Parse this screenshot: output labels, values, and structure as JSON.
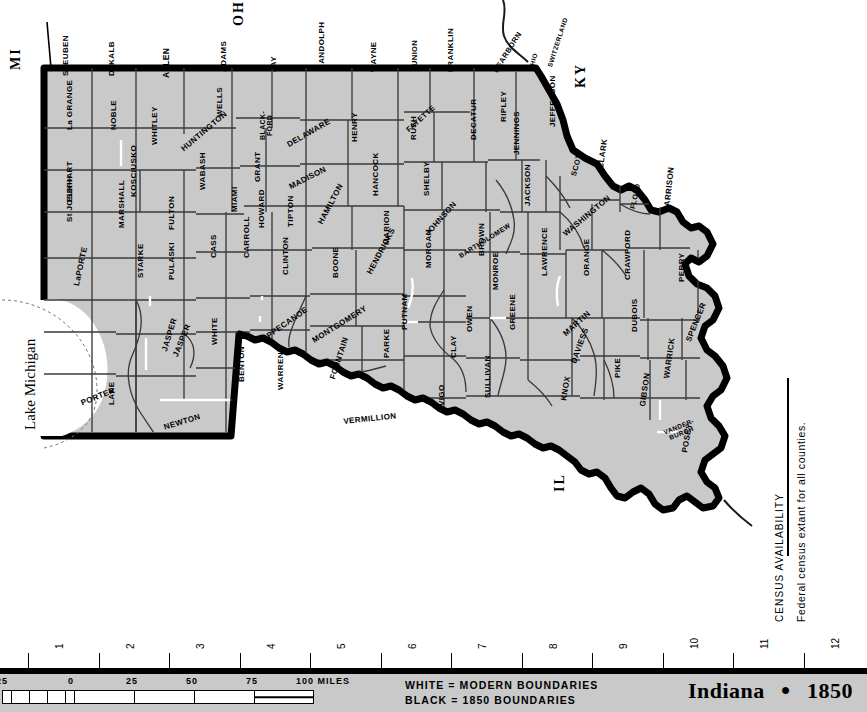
{
  "header": {
    "state_abbr": "IN",
    "year": "1850",
    "separator": "●",
    "page_number": "111"
  },
  "map": {
    "title_state": "Indiana",
    "title_year": "1850",
    "title_separator": "●",
    "neighbors": [
      {
        "id": "mi",
        "label": "MI"
      },
      {
        "id": "oh",
        "label": "OH"
      },
      {
        "id": "ky",
        "label": "KY"
      },
      {
        "id": "il",
        "label": "IL"
      }
    ],
    "water": {
      "lake_label": "Lake Michigan"
    },
    "counties": [
      {
        "name": "STEUBEN",
        "x": 62,
        "y": 76,
        "rot": -90,
        "size": 8
      },
      {
        "name": "DeKALB",
        "x": 108,
        "y": 76,
        "rot": -90,
        "size": 8
      },
      {
        "name": "ALLEN",
        "x": 162,
        "y": 78,
        "rot": -90,
        "size": 8.5
      },
      {
        "name": "ADAMS",
        "x": 220,
        "y": 72,
        "rot": -90,
        "size": 8
      },
      {
        "name": "WELLS",
        "x": 216,
        "y": 117,
        "rot": -90,
        "size": 8
      },
      {
        "name": "JAY",
        "x": 270,
        "y": 72,
        "rot": -90,
        "size": 8
      },
      {
        "name": "RANDOLPH",
        "x": 318,
        "y": 70,
        "rot": -90,
        "size": 8
      },
      {
        "name": "WAYNE",
        "x": 370,
        "y": 72,
        "rot": -90,
        "size": 8
      },
      {
        "name": "UNION",
        "x": 411,
        "y": 66,
        "rot": -90,
        "size": 7.5
      },
      {
        "name": "FAYETTE",
        "x": 405,
        "y": 128,
        "rot": -42,
        "size": 7.5
      },
      {
        "name": "FRANKLIN",
        "x": 447,
        "y": 72,
        "rot": -90,
        "size": 8
      },
      {
        "name": "DEARBORN",
        "x": 492,
        "y": 70,
        "rot": -58,
        "size": 7.5
      },
      {
        "name": "OHIO",
        "x": 528,
        "y": 70,
        "rot": -75,
        "size": 6.5
      },
      {
        "name": "SWITZERLAND",
        "x": 547,
        "y": 66,
        "rot": -72,
        "size": 6.5
      },
      {
        "name": "La GRANGE",
        "x": 66,
        "y": 130,
        "rot": -90,
        "size": 8
      },
      {
        "name": "NOBLE",
        "x": 110,
        "y": 130,
        "rot": -90,
        "size": 8
      },
      {
        "name": "WHITLEY",
        "x": 151,
        "y": 145,
        "rot": -90,
        "size": 8
      },
      {
        "name": "HUNTINGTON",
        "x": 180,
        "y": 147,
        "rot": -40,
        "size": 8
      },
      {
        "name": "BLACK-\nFORD",
        "x": 259,
        "y": 140,
        "rot": -90,
        "size": 7
      },
      {
        "name": "DELAWARE",
        "x": 286,
        "y": 142,
        "rot": -30,
        "size": 8
      },
      {
        "name": "HENRY",
        "x": 351,
        "y": 142,
        "rot": -90,
        "size": 8
      },
      {
        "name": "RUSH",
        "x": 410,
        "y": 140,
        "rot": -90,
        "size": 8
      },
      {
        "name": "DECATUR",
        "x": 470,
        "y": 140,
        "rot": -90,
        "size": 8
      },
      {
        "name": "RIPLEY",
        "x": 500,
        "y": 122,
        "rot": -90,
        "size": 8
      },
      {
        "name": "JENNINGS",
        "x": 513,
        "y": 155,
        "rot": -90,
        "size": 8
      },
      {
        "name": "JEFFERSON",
        "x": 549,
        "y": 127,
        "rot": -90,
        "size": 8
      },
      {
        "name": "SCOTT",
        "x": 570,
        "y": 175,
        "rot": -75,
        "size": 7.5
      },
      {
        "name": "CLARK",
        "x": 597,
        "y": 168,
        "rot": -82,
        "size": 8
      },
      {
        "name": "ELKHART",
        "x": 66,
        "y": 202,
        "rot": -90,
        "size": 8
      },
      {
        "name": "KOSCIUSKO",
        "x": 130,
        "y": 197,
        "rot": -90,
        "size": 8
      },
      {
        "name": "WABASH",
        "x": 199,
        "y": 190,
        "rot": -90,
        "size": 8
      },
      {
        "name": "MIAMI",
        "x": 231,
        "y": 212,
        "rot": -90,
        "size": 8
      },
      {
        "name": "GRANT",
        "x": 254,
        "y": 182,
        "rot": -90,
        "size": 8
      },
      {
        "name": "MADISON",
        "x": 288,
        "y": 184,
        "rot": -27,
        "size": 8
      },
      {
        "name": "HANCOCK",
        "x": 372,
        "y": 196,
        "rot": -90,
        "size": 8
      },
      {
        "name": "SHELBY",
        "x": 423,
        "y": 196,
        "rot": -90,
        "size": 8
      },
      {
        "name": "BARTHOLOMEW",
        "x": 458,
        "y": 254,
        "rot": -32,
        "size": 6.8
      },
      {
        "name": "JACKSON",
        "x": 524,
        "y": 206,
        "rot": -90,
        "size": 8
      },
      {
        "name": "WASHINGTON",
        "x": 562,
        "y": 232,
        "rot": -40,
        "size": 8
      },
      {
        "name": "FLOYD",
        "x": 629,
        "y": 208,
        "rot": -78,
        "size": 7
      },
      {
        "name": "HARRISON",
        "x": 663,
        "y": 212,
        "rot": -84,
        "size": 8
      },
      {
        "name": "St JOSEPH",
        "x": 66,
        "y": 222,
        "rot": -90,
        "size": 8
      },
      {
        "name": "MARSHALL",
        "x": 118,
        "y": 228,
        "rot": -90,
        "size": 8
      },
      {
        "name": "FULTON",
        "x": 168,
        "y": 230,
        "rot": -90,
        "size": 8
      },
      {
        "name": "HOWARD",
        "x": 258,
        "y": 228,
        "rot": -90,
        "size": 8
      },
      {
        "name": "TIPTON",
        "x": 287,
        "y": 227,
        "rot": -90,
        "size": 8
      },
      {
        "name": "HAMILTON",
        "x": 317,
        "y": 222,
        "rot": -62,
        "size": 8
      },
      {
        "name": "MARION",
        "x": 383,
        "y": 245,
        "rot": -90,
        "size": 8
      },
      {
        "name": "JOHNSON",
        "x": 424,
        "y": 232,
        "rot": -48,
        "size": 8
      },
      {
        "name": "CASS",
        "x": 210,
        "y": 258,
        "rot": -90,
        "size": 8
      },
      {
        "name": "CARROLL",
        "x": 243,
        "y": 258,
        "rot": -90,
        "size": 8
      },
      {
        "name": "LaPORTE",
        "x": 73,
        "y": 285,
        "rot": -78,
        "size": 8
      },
      {
        "name": "STARKE",
        "x": 137,
        "y": 278,
        "rot": -90,
        "size": 8
      },
      {
        "name": "PULASKI",
        "x": 168,
        "y": 280,
        "rot": -90,
        "size": 8
      },
      {
        "name": "WHITE",
        "x": 211,
        "y": 345,
        "rot": -90,
        "size": 8
      },
      {
        "name": "CLINTON",
        "x": 282,
        "y": 275,
        "rot": -90,
        "size": 8
      },
      {
        "name": "BOONE",
        "x": 332,
        "y": 278,
        "rot": -90,
        "size": 8
      },
      {
        "name": "HENDRICKS",
        "x": 366,
        "y": 272,
        "rot": -62,
        "size": 8
      },
      {
        "name": "MORGAN",
        "x": 425,
        "y": 268,
        "rot": -90,
        "size": 8
      },
      {
        "name": "BROWN",
        "x": 478,
        "y": 256,
        "rot": -90,
        "size": 8
      },
      {
        "name": "MONROE",
        "x": 492,
        "y": 290,
        "rot": -90,
        "size": 8
      },
      {
        "name": "LAWRENCE",
        "x": 541,
        "y": 276,
        "rot": -90,
        "size": 8
      },
      {
        "name": "ORANGE",
        "x": 583,
        "y": 276,
        "rot": -90,
        "size": 8
      },
      {
        "name": "CRAWFORD",
        "x": 624,
        "y": 280,
        "rot": -90,
        "size": 8
      },
      {
        "name": "PERRY",
        "x": 678,
        "y": 282,
        "rot": -90,
        "size": 8
      },
      {
        "name": "PORTER",
        "x": 80,
        "y": 400,
        "rot": -22,
        "size": 8
      },
      {
        "name": "JASPER",
        "x": 161,
        "y": 350,
        "rot": -73,
        "size": 8
      },
      {
        "name": "JASPER",
        "x": 172,
        "y": 355,
        "rot": -68,
        "size": 8
      },
      {
        "name": "NEWTON",
        "x": 163,
        "y": 424,
        "rot": -17,
        "size": 8
      },
      {
        "name": "LAKE",
        "x": 108,
        "y": 405,
        "rot": -90,
        "size": 8
      },
      {
        "name": "BENTON",
        "x": 238,
        "y": 382,
        "rot": -90,
        "size": 8
      },
      {
        "name": "WARREN",
        "x": 277,
        "y": 390,
        "rot": -90,
        "size": 8
      },
      {
        "name": "TIPPECANOE",
        "x": 259,
        "y": 338,
        "rot": -35,
        "size": 8
      },
      {
        "name": "MONTGOMERY",
        "x": 311,
        "y": 338,
        "rot": -32,
        "size": 8
      },
      {
        "name": "FOUNTAIN",
        "x": 329,
        "y": 378,
        "rot": -72,
        "size": 8
      },
      {
        "name": "PARKE",
        "x": 383,
        "y": 358,
        "rot": -90,
        "size": 8
      },
      {
        "name": "PUTNAM",
        "x": 401,
        "y": 330,
        "rot": -90,
        "size": 8
      },
      {
        "name": "VERMILLION",
        "x": 343,
        "y": 418,
        "rot": -6,
        "size": 8
      },
      {
        "name": "CLAY",
        "x": 450,
        "y": 358,
        "rot": -90,
        "size": 8
      },
      {
        "name": "OWEN",
        "x": 466,
        "y": 332,
        "rot": -90,
        "size": 8
      },
      {
        "name": "GREENE",
        "x": 509,
        "y": 330,
        "rot": -90,
        "size": 8
      },
      {
        "name": "VIGO",
        "x": 438,
        "y": 406,
        "rot": -90,
        "size": 8
      },
      {
        "name": "SULLIVAN",
        "x": 484,
        "y": 398,
        "rot": -90,
        "size": 8
      },
      {
        "name": "MARTIN",
        "x": 562,
        "y": 332,
        "rot": -42,
        "size": 8
      },
      {
        "name": "DAVIESS",
        "x": 570,
        "y": 362,
        "rot": -70,
        "size": 8
      },
      {
        "name": "KNOX",
        "x": 560,
        "y": 400,
        "rot": -80,
        "size": 8
      },
      {
        "name": "DUBOIS",
        "x": 631,
        "y": 332,
        "rot": -90,
        "size": 8
      },
      {
        "name": "PIKE",
        "x": 614,
        "y": 378,
        "rot": -90,
        "size": 8
      },
      {
        "name": "GIBSON",
        "x": 639,
        "y": 406,
        "rot": -82,
        "size": 8
      },
      {
        "name": "SPENCER",
        "x": 685,
        "y": 340,
        "rot": -68,
        "size": 8
      },
      {
        "name": "WARRICK",
        "x": 663,
        "y": 378,
        "rot": -82,
        "size": 8
      },
      {
        "name": "VANDER-\nBURGH",
        "x": 663,
        "y": 430,
        "rot": -22,
        "size": 6.5
      },
      {
        "name": "POSEY",
        "x": 681,
        "y": 452,
        "rot": -80,
        "size": 8
      }
    ]
  },
  "census_availability": {
    "title": "CENSUS AVAILABILITY",
    "note": "Federal census extant for all counties."
  },
  "ruler": {
    "ticks": [
      "1",
      "2",
      "3",
      "4",
      "5",
      "6",
      "7",
      "8",
      "9",
      "10",
      "11",
      "12"
    ]
  },
  "scale": {
    "labels": [
      "25",
      "0",
      "25",
      "50",
      "75",
      "100 MILES"
    ]
  },
  "legend": {
    "line_white": "WHITE = MODERN BOUNDARIES",
    "line_black": "BLACK = 1850 BOUNDARIES"
  },
  "colors": {
    "land": "#c9c9c9",
    "bottom_bar": "#c9c9c9",
    "boundary_1850": "#000000",
    "boundary_modern": "#ffffff",
    "county_line": "#3a3a3a",
    "water": "#ffffff"
  }
}
